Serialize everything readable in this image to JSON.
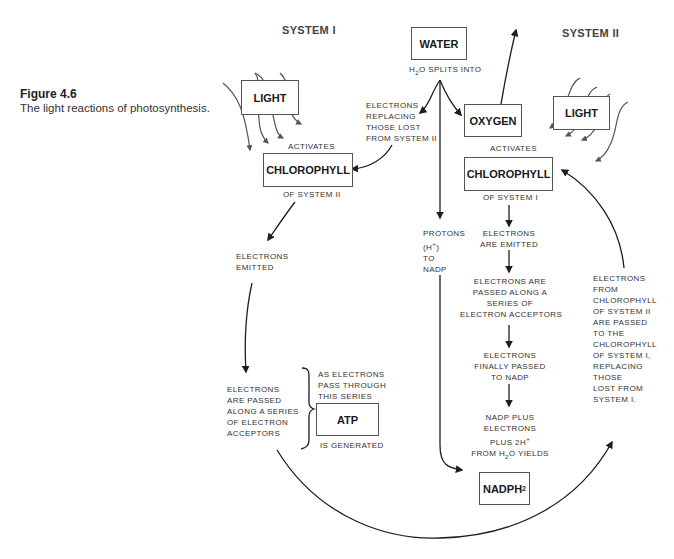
{
  "figure": {
    "title": "Figure 4.6",
    "caption": "The light reactions of photosynthesis."
  },
  "headers": {
    "system_left": "SYSTEM I",
    "system_right": "SYSTEM II"
  },
  "boxes": {
    "water": "WATER",
    "light_left": "LIGHT",
    "light_right": "LIGHT",
    "oxygen": "OXYGEN",
    "chlorophyll_left": "CHLOROPHYLL",
    "chlorophyll_right": "CHLOROPHYLL",
    "atp": "ATP",
    "nadph2_main": "NADPH",
    "nadph2_sub": "2"
  },
  "labels": {
    "h2o_splits": {
      "pre": "H",
      "sub": "2",
      "post": "O SPLITS INTO"
    },
    "activates_left": "ACTIVATES",
    "activates_right": "ACTIVATES",
    "of_system_ii": "OF SYSTEM II",
    "of_system_i": "OF SYSTEM I",
    "electrons_replacing": [
      "ELECTRONS",
      "REPLACING",
      "THOSE LOST",
      "FROM SYSTEM II"
    ],
    "electrons_emitted_left": [
      "ELECTRONS",
      "EMITTED"
    ],
    "electrons_passed_left": [
      "ELECTRONS",
      "ARE PASSED",
      "ALONG A SERIES",
      "OF ELECTRON",
      "ACCEPTORS"
    ],
    "as_electrons": [
      "AS ELECTRONS",
      "PASS THROUGH",
      "THIS SERIES"
    ],
    "is_generated": "IS GENERATED",
    "protons": {
      "line1": "PROTONS",
      "line2_pre": "(H",
      "line2_sup": "+",
      "line2_post": ")",
      "line3": "TO",
      "line4": "NADP"
    },
    "electrons_emitted_right": [
      "ELECTRONS",
      "ARE EMITTED"
    ],
    "electrons_passed_right": [
      "ELECTRONS ARE",
      "PASSED ALONG A",
      "SERIES OF",
      "ELECTRON ACCEPTORS"
    ],
    "electrons_finally": [
      "ELECTRONS",
      "FINALLY PASSED",
      "TO NADP"
    ],
    "nadp_plus": {
      "l1": "NADP PLUS",
      "l2": "ELECTRONS",
      "l3_pre": "PLUS 2H",
      "l3_sup": "+",
      "l4_pre": "FROM H",
      "l4_sub": "2",
      "l4_post": "O YIELDS"
    },
    "electrons_from_chlorophyll": [
      "ELECTRONS",
      "FROM",
      "CHLOROPHYLL",
      "OF SYSTEM II",
      "ARE PASSED",
      "TO THE",
      "CHLOROPHYLL",
      "OF SYSTEM I,",
      "REPLACING",
      "THOSE",
      "LOST FROM",
      "SYSTEM I."
    ]
  },
  "colors": {
    "line": "#1e1e1e",
    "light_rays": "#555555",
    "box_border": "#555555"
  }
}
